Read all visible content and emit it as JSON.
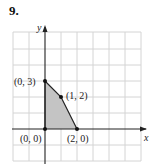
{
  "problem_number": "9.",
  "axes": {
    "x_label": "x",
    "y_label": "y"
  },
  "grid": {
    "cols": 8,
    "rows": 8,
    "x_min": -2,
    "x_max": 6,
    "y_min": -2,
    "y_max": 6
  },
  "region": {
    "fill": "#c8c8c8",
    "vertices": [
      [
        0,
        0
      ],
      [
        0,
        3
      ],
      [
        1,
        2
      ],
      [
        2,
        0
      ]
    ]
  },
  "points": [
    {
      "label": "(0, 3)",
      "x": 0,
      "y": 3
    },
    {
      "label": "(1, 2)",
      "x": 1,
      "y": 2
    },
    {
      "label": "(0, 0)",
      "x": 0,
      "y": 0
    },
    {
      "label": "(2, 0)",
      "x": 2,
      "y": 0
    }
  ]
}
